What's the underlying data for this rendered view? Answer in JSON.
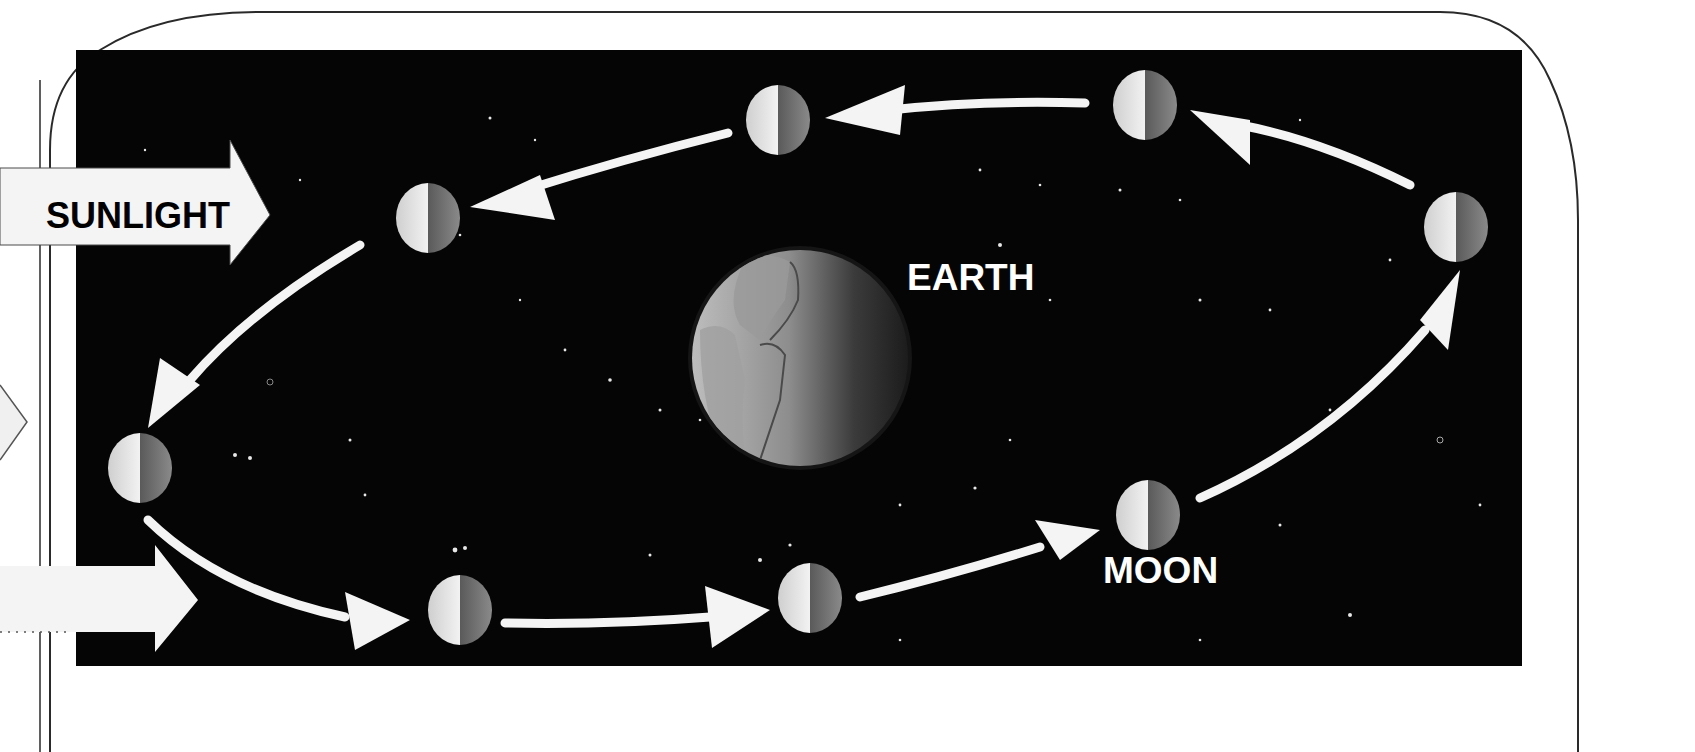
{
  "diagram": {
    "labels": {
      "sunlight": "SUNLIGHT",
      "earth": "EARTH",
      "moon": "MOON"
    },
    "colors": {
      "space": "#050505",
      "arrow": "#f4f4f4",
      "frame": "#2a2a2a",
      "moon_lit": "#e6e6e6",
      "moon_dark": "#6a6a6a",
      "earth_lit": "#d8d8d8",
      "earth_dark": "#3a3a3a",
      "label_text_light": "#ffffff",
      "label_text_dark": "#000000"
    },
    "orbit_direction": "counterclockwise",
    "moon_positions": [
      {
        "id": "top-right",
        "cx": 1145,
        "cy": 105
      },
      {
        "id": "top-center",
        "cx": 778,
        "cy": 120
      },
      {
        "id": "upper-left",
        "cx": 428,
        "cy": 218
      },
      {
        "id": "far-left",
        "cx": 140,
        "cy": 468
      },
      {
        "id": "bottom-left",
        "cx": 460,
        "cy": 610
      },
      {
        "id": "bottom-center",
        "cx": 810,
        "cy": 598
      },
      {
        "id": "bottom-right",
        "cx": 1148,
        "cy": 515
      },
      {
        "id": "far-right",
        "cx": 1456,
        "cy": 227
      }
    ],
    "sunlight_arrows": [
      {
        "id": "upper",
        "label_shown": true
      },
      {
        "id": "lower",
        "label_shown": false
      }
    ]
  }
}
